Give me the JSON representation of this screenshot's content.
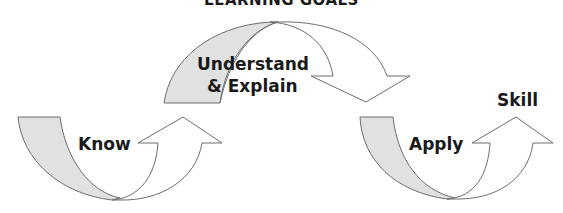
{
  "diagram": {
    "title": "LEARNING GOALS",
    "stages": [
      {
        "label": "Know"
      },
      {
        "label": "Understand",
        "label2": "& Explain"
      },
      {
        "label": "Apply"
      },
      {
        "label": "Skill"
      }
    ],
    "colors": {
      "shade": "#e1e1e1",
      "outline": "#6e6e6e",
      "text": "#1a1a1a",
      "background": "#ffffff"
    }
  }
}
